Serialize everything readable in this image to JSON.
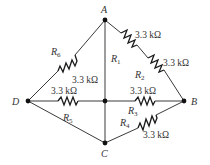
{
  "nodes": {
    "A": {
      "label": "A"
    },
    "B": {
      "label": "B"
    },
    "C": {
      "label": "C"
    },
    "D": {
      "label": "D"
    }
  },
  "resistors": [
    {
      "id": "R1",
      "name": "R",
      "sub": "1",
      "value": "3.3 kΩ",
      "between": [
        "A",
        "midpoint A-B"
      ]
    },
    {
      "id": "R2",
      "name": "R",
      "sub": "2",
      "value": "3.3 kΩ",
      "between": [
        "midpoint A-B",
        "B"
      ]
    },
    {
      "id": "R3",
      "name": "R",
      "sub": "3",
      "value": "3.3 kΩ",
      "between": [
        "center",
        "B"
      ]
    },
    {
      "id": "R4",
      "name": "R",
      "sub": "4",
      "value": "3.3 kΩ",
      "between": [
        "C",
        "B"
      ]
    },
    {
      "id": "R5",
      "name": "R",
      "sub": "5",
      "value": "3.3 kΩ",
      "between": [
        "D",
        "center"
      ]
    },
    {
      "id": "R6",
      "name": "R",
      "sub": "6",
      "value": "3.3 kΩ",
      "between": [
        "D",
        "A"
      ]
    }
  ]
}
